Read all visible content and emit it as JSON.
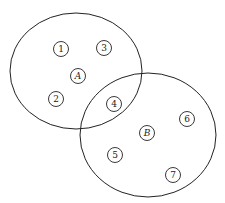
{
  "diagram": {
    "type": "venn",
    "sets": [
      {
        "name": "A",
        "cx": 76,
        "cy": 71,
        "rx": 66,
        "ry": 58
      },
      {
        "name": "B",
        "cx": 148,
        "cy": 135,
        "rx": 68,
        "ry": 62
      }
    ],
    "elements": [
      {
        "label": "1",
        "x": 61,
        "y": 49,
        "italic": false
      },
      {
        "label": "3",
        "x": 104,
        "y": 48,
        "italic": false
      },
      {
        "label": "A",
        "x": 78,
        "y": 76,
        "italic": true
      },
      {
        "label": "2",
        "x": 56,
        "y": 99,
        "italic": false
      },
      {
        "label": "4",
        "x": 114,
        "y": 104,
        "italic": false
      },
      {
        "label": "B",
        "x": 147,
        "y": 133,
        "italic": true
      },
      {
        "label": "6",
        "x": 187,
        "y": 119,
        "italic": false
      },
      {
        "label": "5",
        "x": 115,
        "y": 155,
        "italic": false
      },
      {
        "label": "7",
        "x": 173,
        "y": 175,
        "italic": false
      }
    ],
    "stroke": "#222222"
  }
}
